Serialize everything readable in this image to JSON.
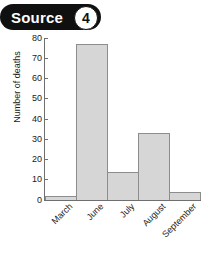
{
  "badge": {
    "label": "Source",
    "number": "4"
  },
  "chart_data": {
    "type": "bar",
    "title": "",
    "xlabel": "",
    "ylabel": "Number of deaths",
    "categories": [
      "March",
      "June",
      "July",
      "August",
      "September"
    ],
    "values": [
      2,
      77,
      14,
      33,
      4
    ],
    "ylim": [
      0,
      80
    ],
    "yticks": [
      0,
      10,
      20,
      30,
      40,
      50,
      60,
      70,
      80
    ],
    "ytick_labels": [
      "0",
      "10",
      "20",
      "30",
      "40",
      "50",
      "60",
      "70",
      "80"
    ],
    "grid": false,
    "legend": false,
    "bar_fill_color": "#d6d6d6",
    "bar_border_color": "#8d8d8d",
    "axis_color": "#6f6f6f",
    "background_color": "#ffffff",
    "xtick_rotation": -45
  }
}
